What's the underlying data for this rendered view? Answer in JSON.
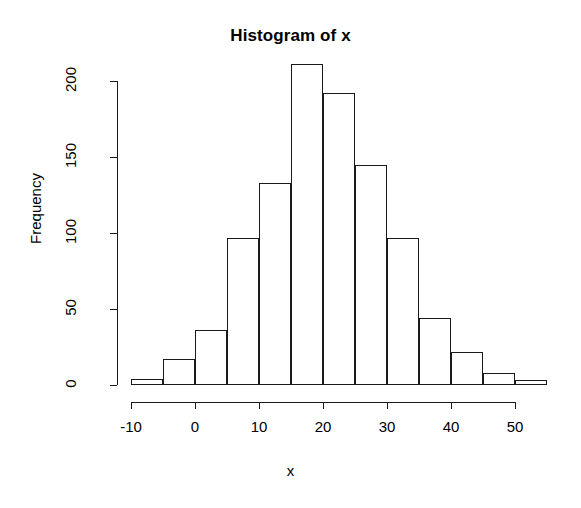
{
  "chart_data": {
    "type": "bar",
    "title": "Histogram of x",
    "xlabel": "x",
    "ylabel": "Frequency",
    "grid": false,
    "legend": null,
    "binwidth": 5,
    "bin_edges": [
      -10,
      -5,
      0,
      5,
      10,
      15,
      20,
      25,
      30,
      35,
      40,
      45,
      50,
      55
    ],
    "categories": [
      "-10 to -5",
      "-5 to 0",
      "0 to 5",
      "5 to 10",
      "10 to 15",
      "15 to 20",
      "20 to 25",
      "25 to 30",
      "30 to 35",
      "35 to 40",
      "40 to 45",
      "45 to 50",
      "50 to 55"
    ],
    "bin_centers": [
      -7.5,
      -2.5,
      2.5,
      7.5,
      12.5,
      17.5,
      22.5,
      27.5,
      32.5,
      37.5,
      42.5,
      47.5,
      52.5
    ],
    "values": [
      4,
      17,
      36,
      97,
      133,
      211,
      192,
      145,
      97,
      44,
      22,
      8,
      3
    ],
    "xlim": [
      -13,
      56
    ],
    "ylim": [
      0,
      212
    ],
    "xticks": [
      -10,
      0,
      10,
      20,
      30,
      40,
      50
    ],
    "xtick_labels": [
      "-10",
      "0",
      "10",
      "20",
      "30",
      "40",
      "50"
    ],
    "yticks": [
      0,
      50,
      100,
      150,
      200
    ],
    "ytick_labels": [
      "0",
      "50",
      "100",
      "150",
      "200"
    ],
    "bar_edge_color": "#1a1a1a",
    "bar_fill_color": "#ffffff",
    "background_color": "#ffffff"
  }
}
